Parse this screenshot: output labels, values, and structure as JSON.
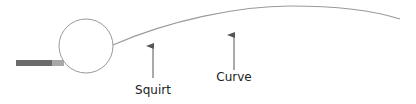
{
  "diagram": {
    "labels": {
      "squirt": "Squirt",
      "curve": "Curve"
    },
    "colors": {
      "line": "#9a9a9a",
      "cue_shaft": "#6b6b6b",
      "cue_tip": "#a8a8a8",
      "arrow": "#555555",
      "text": "#222222"
    },
    "elements": {
      "cue_stick": {
        "x": 16,
        "y": 60,
        "shaft_width": 36,
        "tip_width": 12,
        "height": 6
      },
      "ball": {
        "cx": 86,
        "cy": 46,
        "r": 27
      },
      "trajectory": {
        "start": [
          113,
          45
        ],
        "end": [
          400,
          19
        ]
      },
      "squirt_arrow": {
        "x": 153,
        "from_y": 78,
        "to_y": 44
      },
      "curve_arrow": {
        "x": 234,
        "from_y": 70,
        "to_y": 33
      }
    }
  }
}
